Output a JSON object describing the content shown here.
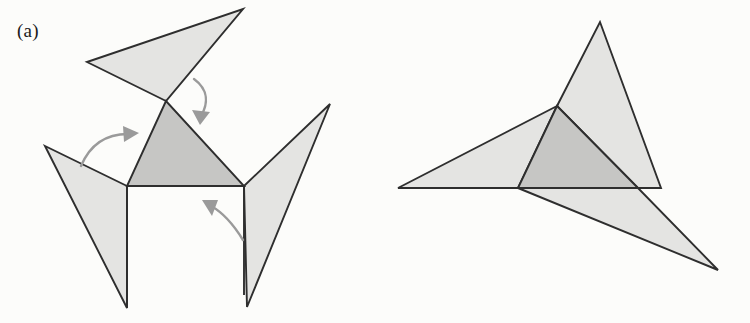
{
  "figure": {
    "background_color": "#fcfcfa",
    "width": 750,
    "height": 323,
    "caption_style": "serif",
    "panels": [
      {
        "id": "a",
        "label": "(a)",
        "description": "Unfolded net: central shaded triangle with three triangular flaps hinged on its edges, curved arrows indicating the folding direction of each flap.",
        "label_x": 17,
        "label_y": 20
      },
      {
        "id": "b",
        "label": "(b)",
        "description": "Partially folded state: the three flaps rotated inward so their tips project outward like a three-pointed star around the central shaded triangle.",
        "label_x": 392,
        "label_y": 20
      }
    ]
  },
  "colors": {
    "flap_fill": "#e4e4e2",
    "core_fill": "#c6c6c4",
    "outline": "#2e2e2e",
    "arrow": "#9a9a9a",
    "label_text": "#1a1a1a",
    "background": "#fcfcfa"
  },
  "geometry": {
    "panel_a": {
      "core_triangle": {
        "name": "central-triangle",
        "points": "166,101 127,186 244,186"
      },
      "flaps": [
        {
          "name": "top-flap",
          "points": "166,101 87,62 243,9"
        },
        {
          "name": "left-flap",
          "points": "127,186 45,146 127,308"
        },
        {
          "name": "right-flap",
          "points": "244,186 330,104 247,307"
        }
      ],
      "hinge_lines": [
        {
          "name": "hinge-left",
          "points": "127,186 127,308"
        },
        {
          "name": "hinge-base",
          "points": "127,186 244,186"
        },
        {
          "name": "hinge-right",
          "points": "244,186 244,295"
        }
      ],
      "arrows": [
        {
          "name": "fold-arrow-top",
          "path": "M 194,79 C 209,90 208,104 201,116",
          "head": "200,125 192,110 210,112"
        },
        {
          "name": "fold-arrow-left",
          "path": "M 81,166 C 92,140 112,134 128,134",
          "head": "139,133 123,126 124,142"
        },
        {
          "name": "fold-arrow-bottom",
          "path": "M 243,240 C 232,222 220,211 211,206",
          "head": "202,200 212,216 218,200"
        }
      ]
    },
    "panel_b": {
      "core_triangle": {
        "name": "central-triangle",
        "points": "557,106 518,188 638,188"
      },
      "flaps": [
        {
          "name": "top-flap",
          "points": "557,106 600,22 661,188 638,188"
        },
        {
          "name": "left-flap",
          "points": "557,106 398,188 518,188"
        },
        {
          "name": "right-flap",
          "points": "518,188 718,270 638,188"
        }
      ]
    }
  }
}
